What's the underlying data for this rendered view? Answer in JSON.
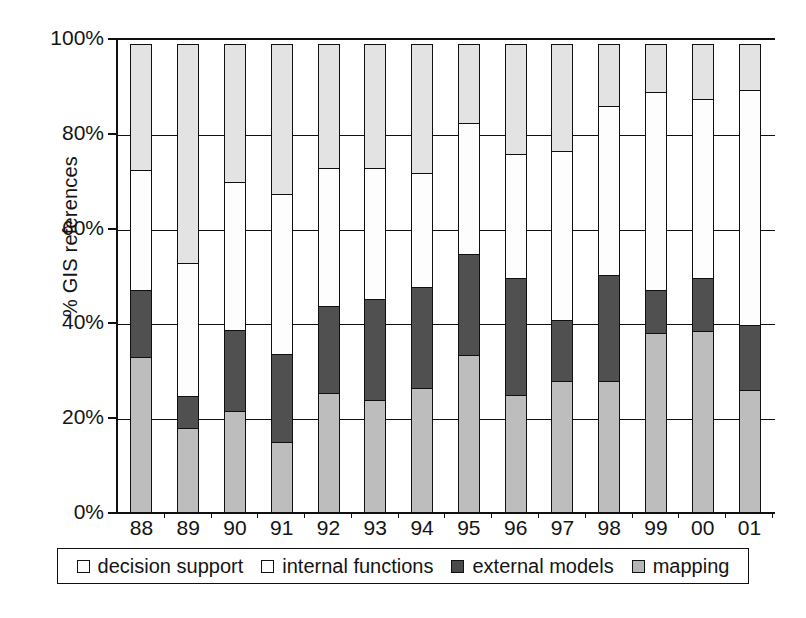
{
  "chart_data": {
    "type": "bar",
    "subtype": "stacked-100-percent",
    "title": "",
    "subtitle": "",
    "xlabel": "",
    "ylabel": "% GIS references",
    "ylim": [
      0,
      100
    ],
    "ytick_labels": [
      "0%",
      "20%",
      "40%",
      "60%",
      "80%",
      "100%"
    ],
    "ytick_values": [
      0,
      20,
      40,
      60,
      80,
      100
    ],
    "grid": true,
    "legend_position": "bottom",
    "categories": [
      "88",
      "89",
      "90",
      "91",
      "92",
      "93",
      "94",
      "95",
      "96",
      "97",
      "98",
      "99",
      "00",
      "01"
    ],
    "series": [
      {
        "name": "mapping",
        "color": "#bdbdbd",
        "values": [
          33,
          18,
          21.5,
          15,
          25.5,
          24,
          26.5,
          33.5,
          25,
          28,
          28,
          38,
          38.5,
          26
        ]
      },
      {
        "name": "external models",
        "color": "#505050",
        "values": [
          14.5,
          7,
          17.5,
          19,
          18.5,
          21.5,
          21.5,
          21.5,
          25,
          13,
          22.5,
          9.5,
          11.5,
          14
        ]
      },
      {
        "name": "internal functions",
        "color": "#fdfdfd",
        "values": [
          25.5,
          28.5,
          31.5,
          34,
          29.5,
          28,
          24.5,
          28,
          26.5,
          36,
          36,
          42,
          38,
          50
        ]
      },
      {
        "name": "decision support",
        "color": "#e3e3e3",
        "values": [
          27,
          46.5,
          29.5,
          32,
          26.5,
          26.5,
          27.5,
          17,
          23.5,
          23,
          13.5,
          10.5,
          12,
          10
        ]
      }
    ],
    "cumulative_tops": {
      "mapping": [
        33,
        18,
        21.5,
        15,
        25.5,
        24,
        26.5,
        33.5,
        25,
        28,
        28,
        38,
        38.5,
        26
      ],
      "external_models": [
        47.5,
        25,
        39,
        34,
        44,
        45.5,
        48,
        55,
        50,
        41,
        50.5,
        47.5,
        50,
        40
      ],
      "internal_functions": [
        73,
        53.5,
        70.5,
        68,
        73.5,
        73.5,
        72.5,
        83,
        76.5,
        77,
        86.5,
        89.5,
        88,
        90
      ],
      "decision_support": [
        100,
        100,
        100,
        100,
        100,
        100,
        100,
        100,
        100,
        100,
        100,
        100,
        100,
        100
      ]
    }
  },
  "legend": {
    "items": [
      {
        "label": "decision support",
        "swatch": "decision"
      },
      {
        "label": "internal functions",
        "swatch": "internal"
      },
      {
        "label": "external models",
        "swatch": "external"
      },
      {
        "label": "mapping",
        "swatch": "mapping"
      }
    ]
  },
  "axes": {
    "y_title": "% GIS references",
    "y_ticks": [
      "100%",
      "80%",
      "60%",
      "40%",
      "20%",
      "0%"
    ],
    "x_ticks": [
      "88",
      "89",
      "90",
      "91",
      "92",
      "93",
      "94",
      "95",
      "96",
      "97",
      "98",
      "99",
      "00",
      "01"
    ]
  },
  "colors": {
    "decision_support": "#e3e3e3",
    "internal_functions": "#fdfdfd",
    "external_models": "#505050",
    "mapping": "#bdbdbd",
    "axis": "#111111",
    "background": "#ffffff"
  }
}
